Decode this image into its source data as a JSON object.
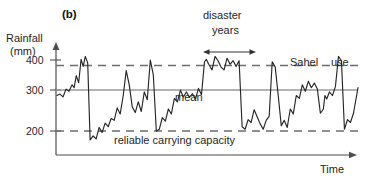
{
  "figure": {
    "panel_letter": "(b)",
    "background_color": "#ffffff",
    "line_color": "#262626",
    "mean_line_color": "#9a9a9a",
    "dashed_line_color": "#6e6e6e"
  },
  "axes": {
    "y_title_line1": "Rainfall",
    "y_title_line2": "(mm)",
    "x_title": "Time",
    "y_ticks": [
      "400",
      "300",
      "200"
    ],
    "y_tick_values": [
      400,
      300,
      200
    ],
    "y_axis_x_px": 56,
    "x_axis_y_px": 155
  },
  "annotations": {
    "disaster": "disaster",
    "years": "years",
    "mean": "mean",
    "reliable_carrying_capacity": "reliable carrying capacity",
    "sahel": "Sahel",
    "use": "use"
  },
  "chart_data": {
    "type": "line",
    "title": "(b)",
    "xlabel": "Time",
    "ylabel": "Rainfall (mm)",
    "ylim": [
      150,
      430
    ],
    "xlim": [
      0,
      100
    ],
    "grid": false,
    "legend": null,
    "reference_lines": [
      {
        "name": "Sahel use",
        "value": 368,
        "style": "dashed",
        "label": "Sahel use"
      },
      {
        "name": "mean",
        "value": 300,
        "style": "solid",
        "label": "mean"
      },
      {
        "name": "reliable carrying capacity",
        "value": 203,
        "style": "dashed",
        "label": "reliable carrying capacity"
      }
    ],
    "span_annotations": [
      {
        "label": "disaster years",
        "x_start": 49.5,
        "x_end": 65.5
      }
    ],
    "series": [
      {
        "name": "Rainfall",
        "x": [
          0.0,
          1.0,
          2.0,
          3.0,
          4.0,
          5.0,
          5.7,
          6.4,
          7.2,
          8.0,
          8.7,
          9.4,
          10.2,
          11.0,
          12.0,
          13.0,
          14.0,
          15.0,
          16.0,
          17.0,
          18.0,
          19.0,
          20.0,
          21.0,
          22.0,
          23.0,
          24.0,
          25.0,
          26.0,
          27.0,
          28.0,
          29.0,
          30.0,
          31.0,
          32.0,
          33.0,
          34.0,
          35.0,
          36.0,
          37.0,
          38.0,
          39.0,
          40.0,
          41.0,
          42.0,
          43.0,
          44.0,
          45.0,
          46.0,
          47.0,
          48.0,
          49.0,
          49.6,
          50.4,
          51.5,
          52.5,
          53.5,
          54.5,
          55.5,
          56.5,
          57.5,
          58.5,
          59.5,
          60.5,
          61.5,
          62.5,
          63.5,
          64.5,
          65.5,
          66.5,
          67.5,
          68.5,
          69.5,
          70.5,
          71.5,
          72.5,
          73.5,
          74.5,
          75.5,
          76.5,
          77.5,
          78.5,
          79.5,
          80.5,
          81.5,
          82.5,
          83.5,
          84.5,
          85.5,
          86.5,
          87.5,
          88.5,
          89.0,
          89.6,
          90.5,
          91.5,
          92.5,
          93.5,
          94.5,
          95.5,
          96.5,
          97.5,
          98.5,
          100.0
        ],
        "y": [
          300,
          304,
          296,
          318,
          312,
          330,
          322,
          356,
          336,
          402,
          382,
          410,
          392,
          175,
          186,
          178,
          210,
          196,
          222,
          212,
          235,
          230,
          265,
          248,
          300,
          370,
          330,
          268,
          252,
          282,
          255,
          310,
          288,
          400,
          358,
          200,
          205,
          238,
          228,
          262,
          248,
          292,
          282,
          315,
          296,
          310,
          295,
          305,
          290,
          320,
          302,
          395,
          402,
          388,
          372,
          410,
          398,
          380,
          372,
          405,
          388,
          398,
          382,
          398,
          212,
          205,
          232,
          224,
          260,
          240,
          220,
          205,
          230,
          242,
          395,
          380,
          300,
          215,
          230,
          210,
          262,
          248,
          300,
          292,
          330,
          312,
          340,
          322,
          335,
          318,
          250,
          262,
          300,
          290,
          310,
          300,
          325,
          410,
          398,
          205,
          232,
          224,
          250,
          322
        ]
      }
    ]
  }
}
